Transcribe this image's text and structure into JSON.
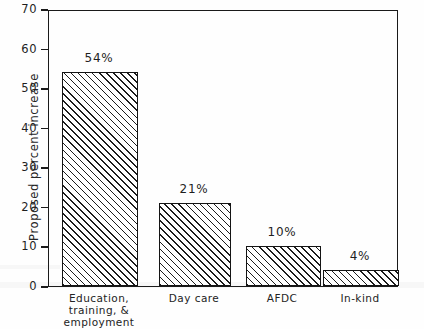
{
  "chart_data": {
    "type": "bar",
    "title": "",
    "xlabel": "",
    "ylabel": "Proposed percent increase",
    "ylim": [
      0,
      70
    ],
    "grid": false,
    "legend": false,
    "categories": [
      "Education,\ntraining, &\nemployment",
      "Day care",
      "AFDC",
      "In-kind"
    ],
    "values": [
      54,
      21,
      10,
      4
    ],
    "value_labels": [
      "54%",
      "21%",
      "10%",
      "4%"
    ],
    "yticks": [
      0,
      10,
      20,
      30,
      40,
      50,
      60,
      70
    ],
    "ytick_labels": [
      "0",
      "10",
      "20",
      "30",
      "40",
      "50",
      "60",
      "70"
    ],
    "bar_style": "hatched-diagonal",
    "colors": {
      "axis": "#1a1a1a",
      "bar_outline": "#141414",
      "bar_hatch": "#1c1c1c",
      "bar_fill": "#ffffff",
      "text": "#1f1f1f",
      "background": "#fefefe"
    }
  }
}
